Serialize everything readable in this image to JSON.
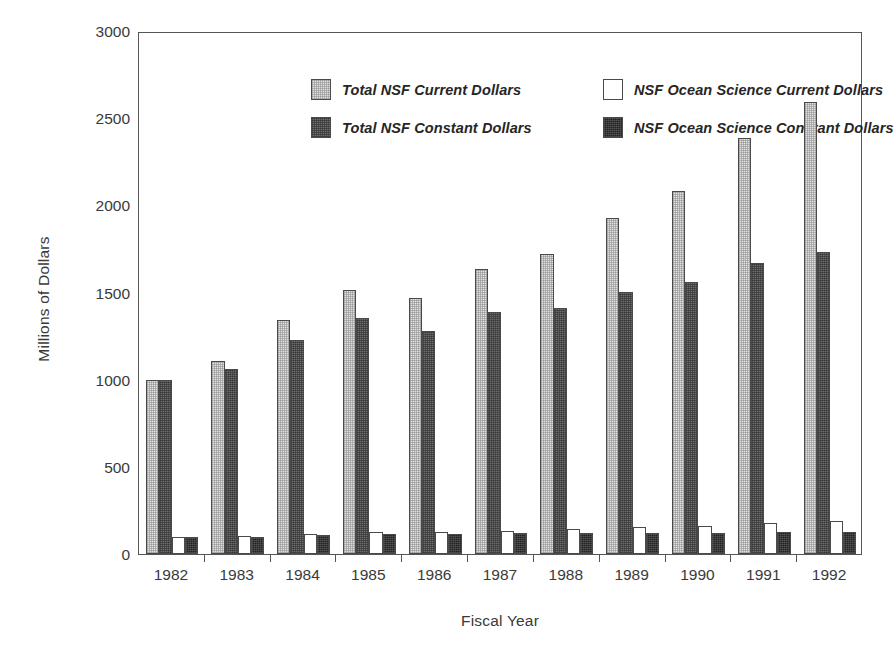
{
  "chart_data": {
    "type": "bar",
    "title": "",
    "subtitle": "",
    "xlabel": "Fiscal Year",
    "ylabel": "Millions of Dollars",
    "categories": [
      "1982",
      "1983",
      "1984",
      "1985",
      "1986",
      "1987",
      "1988",
      "1989",
      "1990",
      "1991",
      "1992"
    ],
    "ylim": [
      0,
      3000
    ],
    "yticks": [
      0,
      500,
      1000,
      1500,
      2000,
      2500,
      3000
    ],
    "ytick_labels": [
      "0",
      "500",
      "1000",
      "1500",
      "2000",
      "2500",
      "3000"
    ],
    "grid": false,
    "legend_position": "top-left-inside",
    "series": [
      {
        "name": "Total NSF  Current Dollars",
        "key": "s-total-current",
        "color": "#e2e2e2",
        "values": [
          1000,
          1105,
          1340,
          1512,
          1470,
          1635,
          1720,
          1930,
          2085,
          2385,
          2595
        ]
      },
      {
        "name": "Total NSF Constant Dollars",
        "key": "s-total-constant",
        "color": "#6e6e6e",
        "values": [
          1000,
          1060,
          1230,
          1355,
          1280,
          1390,
          1410,
          1505,
          1560,
          1670,
          1735
        ]
      },
      {
        "name": "NSF Ocean Science Current Dollars",
        "key": "s-ocean-current",
        "color": "#ffffff",
        "values": [
          95,
          103,
          113,
          124,
          127,
          134,
          145,
          156,
          163,
          176,
          188
        ]
      },
      {
        "name": "NSF Ocean Science Constant Dollars",
        "key": "s-ocean-constant",
        "color": "#232323",
        "values": [
          95,
          100,
          110,
          113,
          113,
          118,
          119,
          122,
          122,
          124,
          127
        ]
      }
    ]
  },
  "axes": {
    "y_title": "Millions of Dollars",
    "x_title": "Fiscal Year"
  },
  "legend": {
    "entries": [
      {
        "label": "Total NSF  Current Dollars",
        "swatch": "s-total-current"
      },
      {
        "label": "Total NSF Constant Dollars",
        "swatch": "s-total-constant"
      },
      {
        "label": "NSF Ocean Science Current Dollars",
        "swatch": "s-ocean-current"
      },
      {
        "label": "NSF Ocean Science Constant Dollars",
        "swatch": "s-ocean-constant"
      }
    ]
  }
}
